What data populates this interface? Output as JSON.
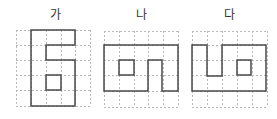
{
  "colors": {
    "outline": "#4a4a4a",
    "grid": "#b8b8b8",
    "label": "#333333"
  },
  "figures": [
    {
      "label": "가",
      "label_x": 55,
      "grid": {
        "x": [
          16,
          31,
          46,
          61,
          75,
          90
        ],
        "y": [
          30,
          45,
          60,
          75,
          90,
          106
        ]
      },
      "outline": [
        [
          31,
          30
        ],
        [
          75,
          30
        ],
        [
          75,
          45
        ],
        [
          46,
          45
        ],
        [
          46,
          60
        ],
        [
          75,
          60
        ],
        [
          75,
          106
        ],
        [
          31,
          106
        ]
      ],
      "inner_square": [
        46,
        75,
        61,
        90
      ]
    },
    {
      "label": "나",
      "label_x": 141,
      "grid": {
        "x": [
          104,
          119,
          134,
          148,
          163,
          178
        ],
        "y": [
          31,
          45,
          60,
          75,
          91,
          107
        ]
      },
      "outline": [
        [
          104,
          45
        ],
        [
          178,
          45
        ],
        [
          178,
          91
        ],
        [
          162,
          91
        ],
        [
          162,
          60
        ],
        [
          148,
          60
        ],
        [
          148,
          91
        ],
        [
          104,
          91
        ]
      ],
      "inner_square": [
        119,
        60,
        134,
        75
      ]
    },
    {
      "label": "다",
      "label_x": 229,
      "grid": {
        "x": [
          192,
          207,
          222,
          237,
          252,
          267
        ],
        "y": [
          31,
          45,
          60,
          75,
          91,
          107
        ]
      },
      "outline": [
        [
          192,
          45
        ],
        [
          207,
          45
        ],
        [
          207,
          76
        ],
        [
          222,
          76
        ],
        [
          222,
          45
        ],
        [
          266,
          45
        ],
        [
          266,
          91
        ],
        [
          192,
          91
        ]
      ],
      "inner_square": [
        237,
        60,
        251,
        75
      ]
    }
  ]
}
